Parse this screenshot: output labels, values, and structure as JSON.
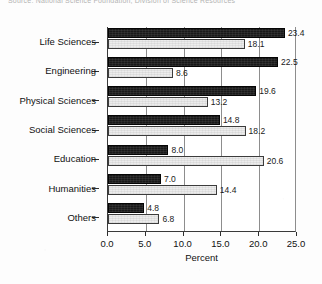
{
  "clipped_header_text": "Source: National Science Foundation, Division of Science Resources",
  "chart_data": {
    "type": "bar",
    "orientation": "horizontal",
    "title": "",
    "xlabel": "Percent",
    "ylabel": "",
    "xlim": [
      0.0,
      25.0
    ],
    "xticks": [
      "0.0",
      "5.0",
      "10.0",
      "15.0",
      "20.0",
      "25.0"
    ],
    "xtick_values": [
      0,
      5,
      10,
      15,
      20,
      25
    ],
    "grid": true,
    "grid_axis": "x",
    "legend": "none",
    "categories": [
      "Life Sciences",
      "Engineering",
      "Physical Sciences",
      "Social Sciences",
      "Education",
      "Humanities",
      "Others"
    ],
    "series": [
      {
        "name": "series-dark",
        "color": "#191919",
        "values": [
          23.4,
          22.5,
          19.6,
          14.8,
          8.0,
          7.0,
          4.8
        ],
        "labels": [
          "23.4",
          "22.5",
          "19.6",
          "14.8",
          "8.0",
          "7.0",
          "4.8"
        ]
      },
      {
        "name": "series-light",
        "color": "#ececec",
        "values": [
          18.1,
          8.6,
          13.2,
          18.2,
          20.6,
          14.4,
          6.8
        ],
        "labels": [
          "18.1",
          "8.6",
          "13.2",
          "18.2",
          "20.6",
          "14.4",
          "6.8"
        ]
      }
    ]
  }
}
